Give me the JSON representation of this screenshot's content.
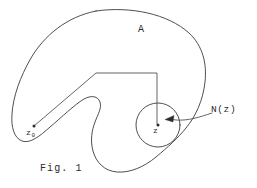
{
  "figure": {
    "caption": "Fig. 1",
    "labels": {
      "region": "A",
      "point_z": "z",
      "point_z0_base": "z",
      "point_z0_subscript": "0",
      "neighborhood": "N(z)"
    },
    "colors": {
      "stroke": "#3b3b3b",
      "text": "#2b2b2b",
      "background": "#ffffff",
      "marker": "#2c2c2c"
    },
    "elements": {
      "region_boundary_name": "open-set-boundary",
      "neighborhood_circle_name": "neighborhood-circle",
      "path_name": "polygonal-path-z0-to-z",
      "pointer_name": "neighborhood-pointer-arrow"
    },
    "geometry": {
      "circle_center_x": 158,
      "circle_center_y": 125,
      "circle_radius": 22,
      "point_z_x": 158,
      "point_z_y": 125,
      "point_z0_x": 33,
      "point_z0_y": 127,
      "path_corner1_x": 96,
      "path_corner1_y": 73,
      "path_corner2_x": 157,
      "path_corner2_y": 73
    }
  }
}
